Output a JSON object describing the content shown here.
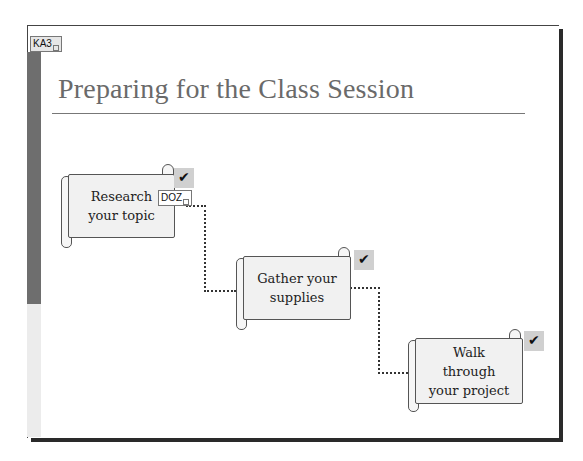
{
  "slide": {
    "title": "Preparing for the Class Session",
    "tags": {
      "slide_tag": "KA3",
      "shape_tag": "DOZ"
    },
    "steps": [
      {
        "label_line1": "Research",
        "label_line2": "your topic",
        "icon": "action-button-icon"
      },
      {
        "label_line1": "Gather your",
        "label_line2": "supplies",
        "icon": "action-button-icon"
      },
      {
        "label_line1": "Walk",
        "label_line2": "through",
        "label_line3": "your project",
        "icon": "action-button-icon"
      }
    ]
  },
  "colors": {
    "title": "#6a6a6a",
    "side_bar_dark": "#6e6e6e",
    "side_bar_light": "#ececec",
    "scroll_fill": "#f1f1f1"
  }
}
